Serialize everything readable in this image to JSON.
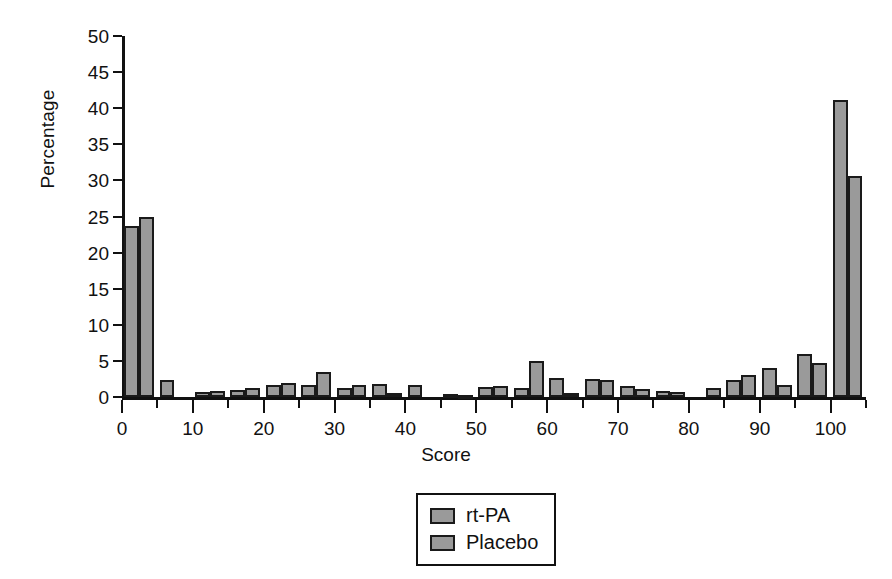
{
  "chart_data": {
    "type": "bar",
    "title": "",
    "subtitle": "",
    "xlabel": "Score",
    "ylabel": "Percentage",
    "xlim": [
      0,
      105
    ],
    "ylim": [
      0,
      50
    ],
    "ytick_values": [
      0,
      5,
      10,
      15,
      20,
      25,
      30,
      35,
      40,
      45,
      50
    ],
    "ytick_labels": [
      "0",
      "5",
      "10",
      "15",
      "20",
      "25",
      "30",
      "35",
      "40",
      "45",
      "50"
    ],
    "xtick_values": [
      0,
      10,
      20,
      30,
      40,
      50,
      60,
      70,
      80,
      90,
      100
    ],
    "xtick_labels": [
      "0",
      "10",
      "20",
      "30",
      "40",
      "50",
      "60",
      "70",
      "80",
      "90",
      "100"
    ],
    "xtick_minor_values": [
      5,
      15,
      25,
      35,
      45,
      55,
      65,
      75,
      85,
      95,
      105
    ],
    "grid": false,
    "legend_position": "bottom-center",
    "bar_fill_color": "#9a9a9a",
    "bar_edge_color": "#1a1a1a",
    "categories": [
      2.5,
      7.5,
      12.5,
      17.5,
      22.5,
      27.5,
      32.5,
      37.5,
      42.5,
      47.5,
      52.5,
      57.5,
      62.5,
      67.5,
      72.5,
      77.5,
      82.5,
      87.5,
      92.5,
      97.5,
      102.5
    ],
    "series": [
      {
        "name": "rt-PA",
        "values": [
          23.7,
          2.4,
          0.7,
          1.0,
          1.7,
          1.7,
          1.3,
          1.8,
          1.6,
          0.4,
          1.4,
          1.3,
          2.6,
          2.5,
          1.5,
          0.8,
          0.0,
          2.3,
          4.0,
          5.9,
          41.1
        ]
      },
      {
        "name": "Placebo",
        "values": [
          25.0,
          0.0,
          0.8,
          1.3,
          1.9,
          3.5,
          1.6,
          0.6,
          0.0,
          0.2,
          1.5,
          5.0,
          0.5,
          2.3,
          1.1,
          0.7,
          1.2,
          3.0,
          1.7,
          4.7,
          30.6
        ]
      }
    ],
    "legend": [
      {
        "label": "rt-PA"
      },
      {
        "label": "Placebo"
      }
    ]
  }
}
